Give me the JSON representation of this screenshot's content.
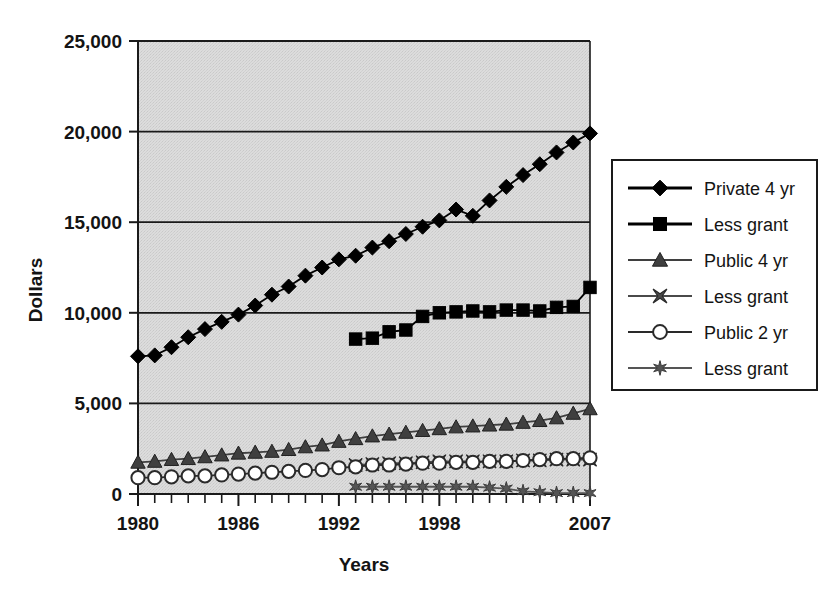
{
  "chart_data": {
    "type": "line",
    "title": "",
    "xlabel": "Years",
    "ylabel": "Dollars",
    "xlim": [
      1980,
      2007
    ],
    "ylim": [
      0,
      25000
    ],
    "grid": true,
    "legend_position": "right",
    "x_tick_labels": [
      "1980",
      "1986",
      "1992",
      "1998",
      "2007"
    ],
    "x_tick_values": [
      1980,
      1986,
      1992,
      1998,
      2007
    ],
    "y_tick_labels": [
      "0",
      "5,000",
      "10,000",
      "15,000",
      "20,000",
      "25,000"
    ],
    "y_tick_values": [
      0,
      5000,
      10000,
      15000,
      20000,
      25000
    ],
    "x": [
      1980,
      1981,
      1982,
      1983,
      1984,
      1985,
      1986,
      1987,
      1988,
      1989,
      1990,
      1991,
      1992,
      1993,
      1994,
      1995,
      1996,
      1997,
      1998,
      1999,
      2000,
      2001,
      2002,
      2003,
      2004,
      2005,
      2006,
      2007
    ],
    "series": [
      {
        "name": "Private 4 yr",
        "marker": "diamond",
        "color": "#000000",
        "x": [
          1980,
          1981,
          1982,
          1983,
          1984,
          1985,
          1986,
          1987,
          1988,
          1989,
          1990,
          1991,
          1992,
          1993,
          1994,
          1995,
          1996,
          1997,
          1998,
          1999,
          2000,
          2001,
          2002,
          2003,
          2004,
          2005,
          2006,
          2007
        ],
        "values": [
          7600,
          7650,
          8100,
          8650,
          9100,
          9500,
          9900,
          10400,
          11000,
          11450,
          12050,
          12500,
          12950,
          13150,
          13600,
          13950,
          14350,
          14750,
          15100,
          15700,
          15350,
          16200,
          16950,
          17600,
          18200,
          18850,
          19400,
          19900
        ]
      },
      {
        "name": "Less grant",
        "marker": "square",
        "color": "#000000",
        "x": [
          1993,
          1994,
          1995,
          1996,
          1997,
          1998,
          1999,
          2000,
          2001,
          2002,
          2003,
          2004,
          2005,
          2006,
          2007
        ],
        "values": [
          8550,
          8600,
          8950,
          9050,
          9800,
          10000,
          10050,
          10100,
          10050,
          10150,
          10150,
          10100,
          10300,
          10350,
          11400
        ]
      },
      {
        "name": "Public 4 yr",
        "marker": "triangle",
        "color": "#3f3f3f",
        "x": [
          1980,
          1981,
          1982,
          1983,
          1984,
          1985,
          1986,
          1987,
          1988,
          1989,
          1990,
          1991,
          1992,
          1993,
          1994,
          1995,
          1996,
          1997,
          1998,
          1999,
          2000,
          2001,
          2002,
          2003,
          2004,
          2005,
          2006,
          2007
        ],
        "values": [
          1750,
          1800,
          1900,
          1950,
          2050,
          2150,
          2250,
          2300,
          2350,
          2450,
          2600,
          2700,
          2900,
          3050,
          3200,
          3300,
          3400,
          3500,
          3600,
          3700,
          3750,
          3800,
          3850,
          3950,
          4050,
          4200,
          4450,
          4700
        ]
      },
      {
        "name": "Less grant",
        "marker": "cross",
        "color": "#4a4a4a",
        "x": [
          1993,
          1994,
          1995,
          1996,
          1997,
          1998,
          1999,
          2000,
          2001,
          2002,
          2003,
          2004,
          2005,
          2006,
          2007
        ],
        "values": [
          1600,
          1650,
          1700,
          1700,
          1750,
          1800,
          1800,
          1800,
          1800,
          1800,
          1850,
          1850,
          1900,
          1900,
          1900
        ]
      },
      {
        "name": "Public 2 yr",
        "marker": "circle",
        "color": "#2a2a2a",
        "x": [
          1980,
          1981,
          1982,
          1983,
          1984,
          1985,
          1986,
          1987,
          1988,
          1989,
          1990,
          1991,
          1992,
          1993,
          1994,
          1995,
          1996,
          1997,
          1998,
          1999,
          2000,
          2001,
          2002,
          2003,
          2004,
          2005,
          2006,
          2007
        ],
        "values": [
          900,
          900,
          950,
          1000,
          1000,
          1050,
          1100,
          1150,
          1200,
          1250,
          1300,
          1350,
          1450,
          1500,
          1600,
          1600,
          1650,
          1700,
          1700,
          1750,
          1750,
          1800,
          1800,
          1850,
          1900,
          1950,
          1950,
          2000
        ]
      },
      {
        "name": "Less grant",
        "marker": "asterisk",
        "color": "#555555",
        "x": [
          1993,
          1994,
          1995,
          1996,
          1997,
          1998,
          1999,
          2000,
          2001,
          2002,
          2003,
          2004,
          2005,
          2006,
          2007
        ],
        "values": [
          400,
          400,
          400,
          400,
          400,
          400,
          400,
          400,
          350,
          300,
          150,
          100,
          50,
          50,
          50
        ]
      }
    ]
  },
  "legend": {
    "items": [
      {
        "label": "Private 4 yr",
        "marker": "diamond"
      },
      {
        "label": "Less grant",
        "marker": "square"
      },
      {
        "label": "Public 4 yr",
        "marker": "triangle"
      },
      {
        "label": "Less grant",
        "marker": "cross"
      },
      {
        "label": "Public 2 yr",
        "marker": "circle"
      },
      {
        "label": "Less grant",
        "marker": "asterisk"
      }
    ]
  },
  "colors": {
    "plot_background": "#d9d9d9",
    "gridline": "#1a1a1a",
    "axis": "#1a1a1a",
    "text": "#141414",
    "legend_border": "#1a1a1a"
  }
}
